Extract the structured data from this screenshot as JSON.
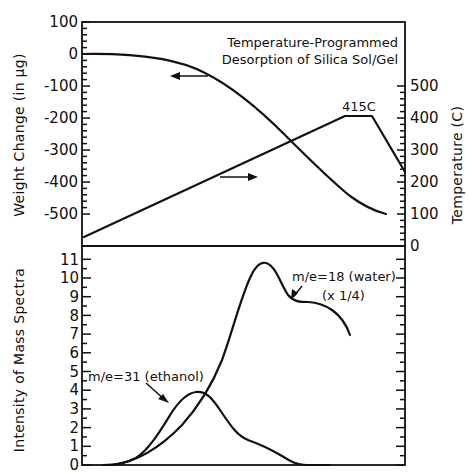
{
  "chart_data": [
    {
      "panel": "upper",
      "type": "line",
      "title": "Temperature-Programmed Desorption of Silica Sol/Gel",
      "xlabel": "",
      "ylabel_left": "Weight Change (in µg)",
      "ylabel_right": "Temperature (C)",
      "ylim_left": [
        -570,
        100
      ],
      "ylim_right": [
        0,
        500
      ],
      "yticks_left": [
        "100",
        "0",
        "-100",
        "-200",
        "-300",
        "-400",
        "-500"
      ],
      "yticks_right": [
        "500",
        "400",
        "300",
        "200",
        "100",
        "0"
      ],
      "grid": false,
      "series": [
        {
          "name": "Weight Change",
          "axis": "left",
          "points_relative_x": [
            0,
            0.1,
            0.2,
            0.3,
            0.4,
            0.5,
            0.6,
            0.7,
            0.8,
            0.9,
            1.0
          ],
          "values": [
            0,
            -2,
            -15,
            -50,
            -110,
            -190,
            -280,
            -360,
            -430,
            -475,
            -490
          ]
        },
        {
          "name": "Temperature",
          "axis": "right",
          "points_relative_x": [
            0,
            0.82,
            0.9,
            1.0
          ],
          "values": [
            25,
            415,
            415,
            220
          ]
        }
      ],
      "annotations": [
        "415C",
        "← (weight curve, left axis)",
        "→ (temperature curve, right axis)"
      ]
    },
    {
      "panel": "lower",
      "type": "line",
      "xlabel": "",
      "ylabel": "Intensity of Mass Spectra",
      "ylim": [
        0,
        11
      ],
      "yticks": [
        "0",
        "1",
        "2",
        "3",
        "4",
        "5",
        "6",
        "7",
        "8",
        "9",
        "10",
        "11"
      ],
      "grid": false,
      "series": [
        {
          "name": "m/e=31 (ethanol)",
          "points_relative_x": [
            0.07,
            0.12,
            0.18,
            0.24,
            0.3,
            0.33,
            0.37,
            0.42,
            0.48,
            0.56,
            0.64,
            0.72
          ],
          "values": [
            0,
            0.1,
            1.0,
            2.6,
            3.9,
            4.0,
            3.5,
            2.2,
            1.3,
            0.9,
            0.3,
            0
          ]
        },
        {
          "name": "m/e=18 (water) (x 1/4)",
          "points_relative_x": [
            0.08,
            0.15,
            0.22,
            0.3,
            0.37,
            0.44,
            0.5,
            0.54,
            0.58,
            0.63,
            0.7,
            0.78,
            0.83
          ],
          "values": [
            0,
            0.4,
            1.5,
            3.3,
            6.0,
            9.8,
            10.9,
            10.5,
            9.0,
            8.8,
            8.7,
            8.1,
            7.2
          ]
        }
      ],
      "annotations": [
        "m/e=31 (ethanol)",
        "m/e=18 (water)",
        "(x 1/4)"
      ]
    }
  ],
  "labels": {
    "title_line1": "Temperature-Programmed",
    "title_line2": "Desorption of Silica Sol/Gel",
    "left_upper_axis_title": "Weight Change (in µg)",
    "right_axis_title": "Temperature (C)",
    "left_lower_axis_title": "Intensity of Mass Spectra",
    "peak_temp": "415C",
    "ethanol": "m/e=31 (ethanol)",
    "water": "m/e=18 (water)",
    "water_scale": "(x 1/4)",
    "weight_ticks": [
      "100",
      "0",
      "-100",
      "-200",
      "-300",
      "-400",
      "-500"
    ],
    "temp_ticks": [
      "500",
      "400",
      "300",
      "200",
      "100",
      "0"
    ],
    "intensity_ticks": [
      "11",
      "10",
      "9",
      "8",
      "7",
      "6",
      "5",
      "4",
      "3",
      "2",
      "1",
      "0"
    ]
  }
}
